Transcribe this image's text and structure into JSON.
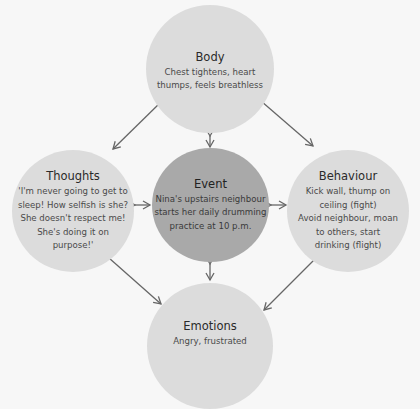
{
  "diagram": {
    "colors": {
      "background": "#f7f7f7",
      "outer_node": "#dcdcdc",
      "center_node": "#a9a9a9",
      "arrow": "#666666"
    },
    "nodes": {
      "body": {
        "title": "Body",
        "lines": [
          "Chest tightens, heart",
          "thumps, feels breathless"
        ]
      },
      "thoughts": {
        "title": "Thoughts",
        "lines": [
          "'I'm never going to get to",
          "sleep! How selfish is she?",
          "She doesn't respect me!",
          "She's doing it on",
          "purpose!'"
        ]
      },
      "event": {
        "title": "Event",
        "lines": [
          "Nina's upstairs neighbour",
          "starts her daily drumming",
          "practice at 10 p.m."
        ]
      },
      "behaviour": {
        "title": "Behaviour",
        "lines": [
          "Kick wall, thump on",
          "ceiling (fight)",
          "Avoid neighbour, moan",
          "to others, start",
          "drinking (flight)"
        ]
      },
      "emotions": {
        "title": "Emotions",
        "lines": [
          "Angry, frustrated"
        ]
      }
    },
    "connections": [
      {
        "from": "body",
        "to": "event",
        "type": "bidirectional"
      },
      {
        "from": "thoughts",
        "to": "event",
        "type": "bidirectional"
      },
      {
        "from": "behaviour",
        "to": "event",
        "type": "bidirectional"
      },
      {
        "from": "emotions",
        "to": "event",
        "type": "bidirectional"
      },
      {
        "from": "body",
        "to": "thoughts",
        "type": "bidirectional"
      },
      {
        "from": "body",
        "to": "behaviour",
        "type": "bidirectional"
      },
      {
        "from": "thoughts",
        "to": "emotions",
        "type": "bidirectional"
      },
      {
        "from": "behaviour",
        "to": "emotions",
        "type": "bidirectional"
      }
    ]
  }
}
